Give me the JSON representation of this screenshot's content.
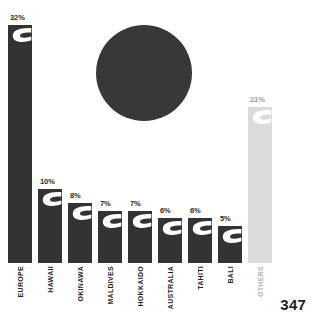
{
  "page": {
    "number": "347",
    "background_color": "#ffffff",
    "bar_color": "#333333",
    "bar_color_muted": "#dcdcdc",
    "circle_color": "#383838",
    "text_color": "#1d1d1d",
    "text_color_muted": "#b4b4b4"
  },
  "decoration": {
    "circle_name": "decorative-circle",
    "circle_cx": 144,
    "circle_cy": 73,
    "circle_r": 48
  },
  "chart_data": {
    "type": "bar",
    "title": "",
    "subtitle": "",
    "xlabel": "",
    "ylabel": "",
    "ylim": [
      0,
      32
    ],
    "grid": false,
    "legend": "none",
    "orientation": "vertical",
    "value_suffix": "%",
    "categories": [
      "EUROPE",
      "HAWAII",
      "OKINAWA",
      "MALDIVES",
      "HOKKAIDO",
      "AUSTRALIA",
      "TAHITI",
      "BALI",
      "OTHERS"
    ],
    "values": [
      32,
      10,
      8,
      7,
      7,
      6,
      6,
      5,
      21
    ],
    "data_labels": [
      "32%",
      "10%",
      "8%",
      "7%",
      "7%",
      "6%",
      "6%",
      "5%",
      "21%"
    ],
    "bar_styles": [
      "dark",
      "dark",
      "dark",
      "dark",
      "dark",
      "dark",
      "dark",
      "dark",
      "muted"
    ],
    "annotations": []
  }
}
